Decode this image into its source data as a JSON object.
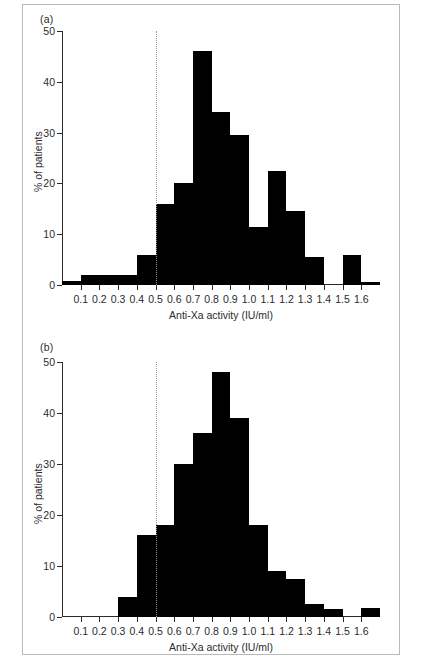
{
  "figure": {
    "panels": [
      {
        "id": "a",
        "label": "(a)",
        "chart_data": {
          "type": "bar",
          "title": "",
          "subtitle": "",
          "xlabel": "Anti-Xa activity (IU/ml)",
          "ylabel": "% of patients",
          "xlim": [
            0.0,
            1.7
          ],
          "ylim": [
            0,
            50
          ],
          "xticks": [
            0.1,
            0.2,
            0.3,
            0.4,
            0.5,
            0.6,
            0.7,
            0.8,
            0.9,
            1.0,
            1.1,
            1.2,
            1.3,
            1.4,
            1.5,
            1.6
          ],
          "xtick_labels": [
            "0.1",
            "0.2",
            "0.3",
            "0.4",
            "0.5",
            "0.6",
            "0.7",
            "0.8",
            "0.9",
            "1.0",
            "1.1",
            "1.2",
            "1.3",
            "1.4",
            "1.5",
            "1.6"
          ],
          "yticks": [
            0,
            10,
            20,
            30,
            40,
            50
          ],
          "ytick_labels": [
            "0",
            "10",
            "20",
            "30",
            "40",
            "50"
          ],
          "grid": false,
          "legend": "none",
          "bin_width": 0.1,
          "bin_starts": [
            0.0,
            0.1,
            0.2,
            0.3,
            0.4,
            0.5,
            0.6,
            0.7,
            0.8,
            0.9,
            1.0,
            1.1,
            1.2,
            1.3,
            1.4,
            1.5,
            1.6
          ],
          "categories": [
            "0.0-0.1",
            "0.1-0.2",
            "0.2-0.3",
            "0.3-0.4",
            "0.4-0.5",
            "0.5-0.6",
            "0.6-0.7",
            "0.7-0.8",
            "0.8-0.9",
            "0.9-1.0",
            "1.0-1.1",
            "1.1-1.2",
            "1.2-1.3",
            "1.3-1.4",
            "1.4-1.5",
            "1.5-1.6",
            "1.6-1.7"
          ],
          "values": [
            0.8,
            2.0,
            2.0,
            2.0,
            6.0,
            16.0,
            20.0,
            46.0,
            34.0,
            29.5,
            11.5,
            22.5,
            14.5,
            5.5,
            0.0,
            6.0,
            0.5
          ],
          "bar_color": "#000000",
          "annotations": [
            {
              "type": "vline",
              "name": "threshold-line",
              "x": 0.5,
              "style": "dotted",
              "color": "#9a9a9a"
            }
          ]
        }
      },
      {
        "id": "b",
        "label": "(b)",
        "chart_data": {
          "type": "bar",
          "title": "",
          "subtitle": "",
          "xlabel": "Anti-Xa activity (IU/ml)",
          "ylabel": "% of patients",
          "xlim": [
            0.0,
            1.7
          ],
          "ylim": [
            0,
            50
          ],
          "xticks": [
            0.1,
            0.2,
            0.3,
            0.4,
            0.5,
            0.6,
            0.7,
            0.8,
            0.9,
            1.0,
            1.1,
            1.2,
            1.3,
            1.4,
            1.5,
            1.6
          ],
          "xtick_labels": [
            "0.1",
            "0.2",
            "0.3",
            "0.4",
            "0.5",
            "0.6",
            "0.7",
            "0.8",
            "0.9",
            "1.0",
            "1.1",
            "1.2",
            "1.3",
            "1.4",
            "1.5",
            "1.6"
          ],
          "yticks": [
            0,
            10,
            20,
            30,
            40,
            50
          ],
          "ytick_labels": [
            "0",
            "10",
            "20",
            "30",
            "40",
            "50"
          ],
          "grid": false,
          "legend": "none",
          "bin_width": 0.1,
          "bin_starts": [
            0.0,
            0.1,
            0.2,
            0.3,
            0.4,
            0.5,
            0.6,
            0.7,
            0.8,
            0.9,
            1.0,
            1.1,
            1.2,
            1.3,
            1.4,
            1.5,
            1.6
          ],
          "categories": [
            "0.0-0.1",
            "0.1-0.2",
            "0.2-0.3",
            "0.3-0.4",
            "0.4-0.5",
            "0.5-0.6",
            "0.6-0.7",
            "0.7-0.8",
            "0.8-0.9",
            "0.9-1.0",
            "1.0-1.1",
            "1.1-1.2",
            "1.2-1.3",
            "1.3-1.4",
            "1.4-1.5",
            "1.5-1.6",
            "1.6-1.7"
          ],
          "values": [
            0.0,
            0.0,
            0.0,
            4.0,
            16.0,
            18.0,
            30.0,
            36.0,
            48.0,
            39.0,
            18.0,
            9.0,
            7.5,
            2.5,
            1.5,
            0.0,
            1.7
          ],
          "bar_color": "#000000",
          "annotations": [
            {
              "type": "vline",
              "name": "threshold-line",
              "x": 0.5,
              "style": "dotted",
              "color": "#9a9a9a"
            }
          ]
        }
      }
    ]
  }
}
